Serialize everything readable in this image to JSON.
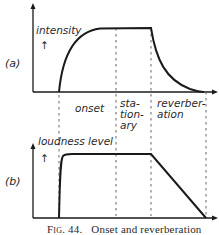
{
  "figure": {
    "caption_prefix": "Fig. 44.",
    "caption_text": "Onset and reverberation"
  },
  "panel_a": {
    "tag": "(a)",
    "ylabel": "intensity",
    "arrow": "↑"
  },
  "panel_b": {
    "tag": "(b)",
    "ylabel": "loudness level",
    "arrow": "↑"
  },
  "phases": {
    "onset": "onset",
    "stationary": "sta-\ntion-\nary",
    "reverberation": "reverber-\nation"
  },
  "colors": {
    "ink": "#1a1a1a",
    "dash": "#555555"
  }
}
